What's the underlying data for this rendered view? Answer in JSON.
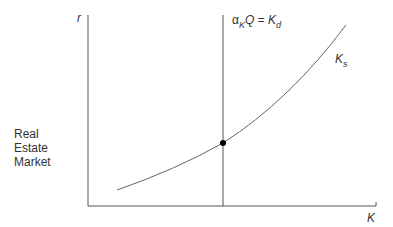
{
  "diagram": {
    "side_label_lines": [
      "Real",
      "Estate",
      "Market"
    ],
    "y_axis_label": "r",
    "x_axis_label": "K",
    "vertical_line_label": {
      "alpha": "α",
      "alpha_sub": "K",
      "main": "Q = K",
      "main_sub": "d"
    },
    "curve_label": {
      "main": "K",
      "sub": "s"
    },
    "colors": {
      "axis": "#555555",
      "curve": "#666666",
      "point": "#000000",
      "text": "#333333"
    }
  }
}
